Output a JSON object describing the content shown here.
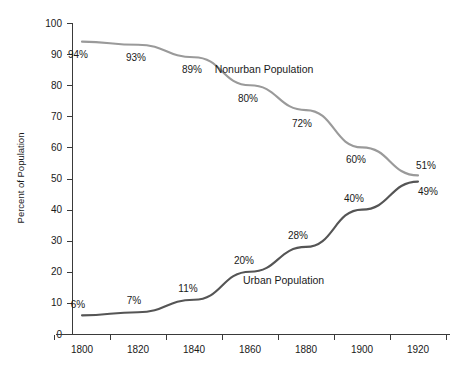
{
  "chart_data": {
    "type": "line",
    "title": "",
    "xlabel": "",
    "ylabel": "Percent of Population",
    "xlim": [
      1790,
      1930
    ],
    "ylim": [
      0,
      100
    ],
    "grid": false,
    "legend_position": "inline-annotation",
    "x": [
      1800,
      1820,
      1840,
      1860,
      1880,
      1900,
      1920
    ],
    "categories": [
      "1800",
      "1820",
      "1840",
      "1860",
      "1880",
      "1900",
      "1920"
    ],
    "yticks": [
      0,
      10,
      20,
      30,
      40,
      50,
      60,
      70,
      80,
      90,
      100
    ],
    "ytick_labels": [
      "0",
      "10",
      "20",
      "30",
      "40",
      "50",
      "60",
      "70",
      "80",
      "90",
      "100"
    ],
    "series": [
      {
        "name": "Nonurban Population",
        "color": "#9a9a9a",
        "values": [
          94,
          93,
          89,
          80,
          72,
          60,
          51
        ],
        "data_labels": [
          "94%",
          "93%",
          "89%",
          "80%",
          "72%",
          "60%",
          "51%"
        ]
      },
      {
        "name": "Urban Population",
        "color": "#555555",
        "values": [
          6,
          7,
          11,
          20,
          28,
          40,
          49
        ],
        "data_labels": [
          "6%",
          "7%",
          "11%",
          "20%",
          "28%",
          "40%",
          "49%"
        ]
      }
    ],
    "annotations": [
      {
        "text": "Nonurban Population",
        "x": 1865,
        "y": 84
      },
      {
        "text": "Urban Population",
        "x": 1872,
        "y": 16
      }
    ]
  }
}
